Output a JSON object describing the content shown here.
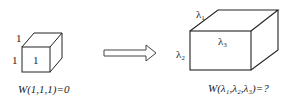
{
  "left_figure": {
    "shape": "unit-cube",
    "labels": {
      "depth": "1",
      "height": "1",
      "face": "1"
    },
    "caption": "W(1,1,1)=0"
  },
  "arrow": {
    "direction": "right",
    "style": "hollow-block-arrow"
  },
  "right_figure": {
    "shape": "rectangular-box",
    "labels": {
      "depth": "λ₁",
      "height": "λ₂",
      "face": "λ₃"
    },
    "caption": "W(λ₁,λ₂,λ₃)=?"
  },
  "colors": {
    "stroke": "#222222",
    "background": "#ffffff"
  }
}
